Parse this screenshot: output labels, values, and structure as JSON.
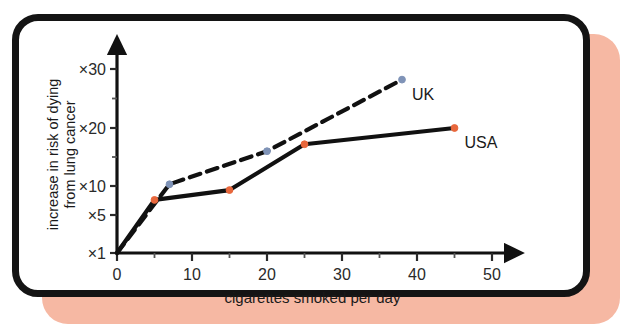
{
  "figure": {
    "frame_color": "#141414",
    "shadow_color": "#f6b8a3",
    "background": "#ffffff"
  },
  "chart_data": {
    "type": "line",
    "title": "",
    "subtitle": "",
    "xlabel": "cigarettes smoked per day",
    "ylabel_line1": "increase in risk of dying",
    "ylabel_line2": "from lung cancer",
    "xlim": [
      0,
      52
    ],
    "ylim_labels": [
      "×1",
      "×5",
      "×10",
      "×20",
      "×30"
    ],
    "x_ticks": [
      0,
      10,
      20,
      30,
      40,
      50
    ],
    "x_tick_labels": [
      "0",
      "10",
      "20",
      "30",
      "40",
      "50"
    ],
    "x_minor_ticks": [
      5,
      15,
      25,
      35,
      45
    ],
    "y_ticks": [
      1,
      5,
      10,
      20,
      30
    ],
    "y_tick_labels": [
      "×1",
      "×5",
      "×10",
      "×20",
      "×30"
    ],
    "y_minor_ticks": [
      15,
      25
    ],
    "grid": false,
    "legend_position": "inline-end-of-line",
    "axis_arrows": true,
    "series": [
      {
        "name": "UK",
        "label": "UK",
        "style": "dashed",
        "line_color": "#111111",
        "marker_color": "#7f93b7",
        "x": [
          0,
          7,
          20,
          38
        ],
        "values": [
          1,
          10.3,
          16,
          28.2
        ]
      },
      {
        "name": "USA",
        "label": "USA",
        "style": "solid",
        "line_color": "#111111",
        "marker_color": "#e8673c",
        "x": [
          0,
          5,
          15,
          25,
          45
        ],
        "values": [
          1,
          7.6,
          9.3,
          17.2,
          20
        ]
      }
    ]
  }
}
